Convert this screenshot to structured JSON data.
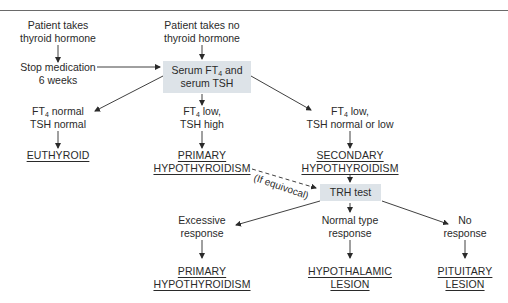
{
  "diagram": {
    "type": "flowchart",
    "topic": "Diagnostic evaluation of hypothyroidism",
    "nodes": {
      "patient_takes": {
        "line1": "Patient takes",
        "line2": "thyroid hormone"
      },
      "stop_medication": {
        "line1": "Stop medication",
        "line2": "6 weeks"
      },
      "patient_takes_no": {
        "line1": "Patient takes no",
        "line2": "thyroid hormone"
      },
      "serum_test": {
        "line1_pre": "Serum FT",
        "line1_sub": "4",
        "line1_post": " and",
        "line2": "serum TSH"
      },
      "ft4_normal": {
        "line1_pre": "FT",
        "line1_sub": "4",
        "line1_post": " normal",
        "line2": "TSH normal"
      },
      "euthyroid": {
        "label": "EUTHYROID"
      },
      "ft4_low_tsh_high": {
        "line1_pre": "FT",
        "line1_sub": "4",
        "line1_post": " low,",
        "line2": "TSH high"
      },
      "primary_hypo_1": {
        "line1": "PRIMARY",
        "line2": "HYPOTHYROIDISM"
      },
      "ft4_low_tsh_normal": {
        "line1_pre": "FT",
        "line1_sub": "4",
        "line1_post": " low,",
        "line2": "TSH normal or low"
      },
      "secondary_hypo": {
        "line1": "SECONDARY",
        "line2": "HYPOTHYROIDISM"
      },
      "trh_test": {
        "label": "TRH test"
      },
      "excessive_response": {
        "line1": "Excessive",
        "line2": "response"
      },
      "primary_hypo_2": {
        "line1": "PRIMARY",
        "line2": "HYPOTHYROIDISM"
      },
      "normal_response": {
        "line1": "Normal type",
        "line2": "response"
      },
      "hypothalamic_lesion": {
        "line1": "HYPOTHALAMIC",
        "line2": "LESION"
      },
      "no_response": {
        "line1": "No",
        "line2": "response"
      },
      "pituitary_lesion": {
        "line1": "PITUITARY",
        "line2": "LESION"
      }
    },
    "edge_labels": {
      "if_equivocal": "(If equivocal)"
    },
    "edges": [
      {
        "from": "patient_takes",
        "to": "stop_medication",
        "style": "solid"
      },
      {
        "from": "stop_medication",
        "to": "serum_test",
        "style": "solid"
      },
      {
        "from": "patient_takes_no",
        "to": "serum_test",
        "style": "solid"
      },
      {
        "from": "serum_test",
        "to": "ft4_normal",
        "style": "solid"
      },
      {
        "from": "serum_test",
        "to": "ft4_low_tsh_high",
        "style": "solid"
      },
      {
        "from": "serum_test",
        "to": "ft4_low_tsh_normal",
        "style": "solid"
      },
      {
        "from": "ft4_normal",
        "to": "euthyroid",
        "style": "solid"
      },
      {
        "from": "ft4_low_tsh_high",
        "to": "primary_hypo_1",
        "style": "solid"
      },
      {
        "from": "ft4_low_tsh_normal",
        "to": "secondary_hypo",
        "style": "solid"
      },
      {
        "from": "primary_hypo_1",
        "to": "trh_test",
        "style": "dashed",
        "label": "(If equivocal)"
      },
      {
        "from": "secondary_hypo",
        "to": "trh_test",
        "style": "solid"
      },
      {
        "from": "trh_test",
        "to": "excessive_response",
        "style": "solid"
      },
      {
        "from": "trh_test",
        "to": "normal_response",
        "style": "solid"
      },
      {
        "from": "trh_test",
        "to": "no_response",
        "style": "solid"
      },
      {
        "from": "excessive_response",
        "to": "primary_hypo_2",
        "style": "solid"
      },
      {
        "from": "normal_response",
        "to": "hypothalamic_lesion",
        "style": "solid"
      },
      {
        "from": "no_response",
        "to": "pituitary_lesion",
        "style": "solid"
      }
    ],
    "colors": {
      "box_fill": "#dde3e8",
      "line": "#2a2a2a",
      "rule": "#6a6a6a"
    }
  }
}
